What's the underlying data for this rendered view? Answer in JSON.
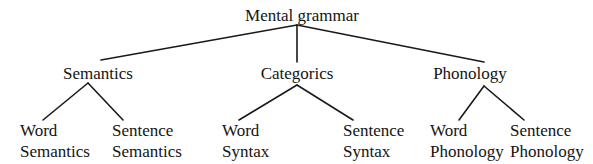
{
  "diagram": {
    "type": "tree",
    "root": {
      "label": "Mental grammar",
      "children": [
        {
          "label": "Semantics",
          "children": [
            {
              "line1": "Word",
              "line2": "Semantics"
            },
            {
              "line1": "Sentence",
              "line2": "Semantics"
            }
          ]
        },
        {
          "label": "Categorics",
          "children": [
            {
              "line1": "Word",
              "line2": "Syntax"
            },
            {
              "line1": "Sentence",
              "line2": "Syntax"
            }
          ]
        },
        {
          "label": "Phonology",
          "children": [
            {
              "line1": "Word",
              "line2": "Phonology"
            },
            {
              "line1": "Sentence",
              "line2": "Phonology"
            }
          ]
        }
      ]
    },
    "colors": {
      "background": "#ffffff",
      "text": "#141414",
      "edges": "#1a1a1a"
    }
  }
}
